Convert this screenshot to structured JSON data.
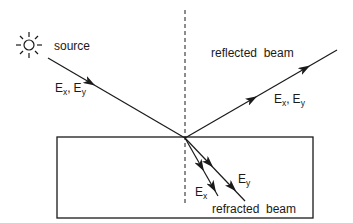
{
  "diagram": {
    "type": "optics-reflection-refraction",
    "labels": {
      "source": "source",
      "incident_field": "E",
      "incident_sub_x": "x",
      "incident_sub_y": "y",
      "comma": ",",
      "reflected": "reflected  beam",
      "reflected_field": "E",
      "reflected_sub_x": "x",
      "reflected_sub_y": "y",
      "refracted": "refracted  beam",
      "refracted_ex": "E",
      "refracted_ex_sub": "x",
      "refracted_ey": "E",
      "refracted_ey_sub": "y"
    },
    "icons": {
      "source": "sun-icon"
    },
    "colors": {
      "line": "#1a1a1a",
      "background": "#ffffff"
    }
  }
}
